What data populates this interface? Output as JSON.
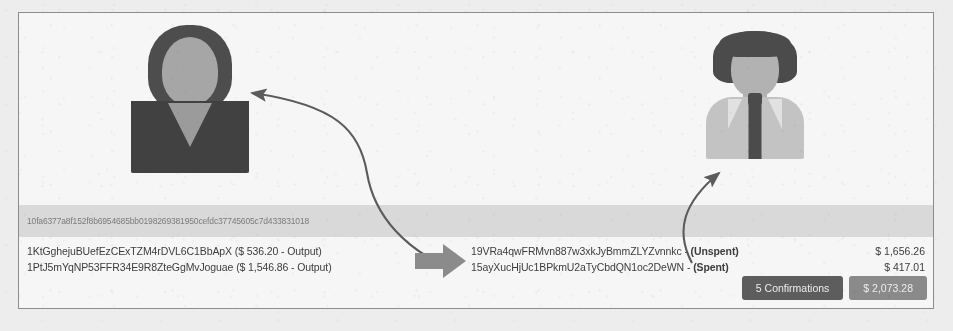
{
  "transaction": {
    "hash": "10fa6377a8f152f8b6954685bb0198269381950cefdc37745605c7d433831018",
    "inputs": [
      {
        "address": "1KtGghejuBUefEzCExTZM4rDVL6C1BbApX",
        "detail": "($ 536.20 - Output)"
      },
      {
        "address": "1PtJ5mYqNP53FFR34E9R8ZteGgMvJoguae",
        "detail": "($ 1,546.86 - Output)"
      }
    ],
    "outputs": [
      {
        "address": "19VRa4qwFRMvn887w3xkJyBmmZLYZvnnkc",
        "separator": " - ",
        "status": "(Unspent)",
        "amount": "$ 1,656.26"
      },
      {
        "address": "15ayXucHjUc1BPkmU2aTyCbdQN1oc2DeWN",
        "separator": " - ",
        "status": "(Spent)",
        "amount": "$ 417.01"
      }
    ],
    "footer": {
      "confirmations_label": "5 Confirmations",
      "total_label": "$ 2,073.28"
    }
  },
  "actors": {
    "sender": {
      "icon": "person-female-avatar-icon"
    },
    "receiver": {
      "icon": "person-male-avatar-icon"
    }
  },
  "colors": {
    "panel_background": "#fbfbfa",
    "panel_border": "#8e8d8a",
    "hash_band": "#dedddb",
    "hash_text": "#7c7b79",
    "body_text": "#3b3a38",
    "button_dark": "#5c5b59",
    "button_light": "#8b8a87",
    "button_text": "#f2f1ef",
    "arrow": "#5a5957"
  }
}
